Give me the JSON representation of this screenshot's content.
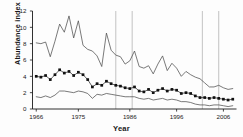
{
  "chart_data": {
    "type": "line",
    "title": "",
    "xlabel": "Year",
    "ylabel": "Abundance index",
    "xlim": [
      1965.2,
      2008.8
    ],
    "ylim": [
      0,
      12
    ],
    "grid": false,
    "legend": "none",
    "y_ticks": [
      0,
      2,
      4,
      6,
      8,
      10,
      12
    ],
    "x_ticks": [
      1966,
      1975,
      1986,
      1996,
      2006
    ],
    "x_tick_labels": [
      "1966",
      "1975",
      "1986",
      "1996",
      "2006"
    ],
    "x": [
      1966,
      1967,
      1968,
      1969,
      1970,
      1971,
      1972,
      1973,
      1974,
      1975,
      1976,
      1977,
      1978,
      1979,
      1980,
      1981,
      1982,
      1983,
      1984,
      1985,
      1986,
      1987,
      1988,
      1989,
      1990,
      1991,
      1992,
      1993,
      1994,
      1995,
      1996,
      1997,
      1998,
      1999,
      2000,
      2001,
      2002,
      2003,
      2004,
      2005,
      2006,
      2007,
      2008
    ],
    "series": [
      {
        "name": "Upper confidence bound",
        "style": "thin-line",
        "values": [
          8.1,
          8.0,
          8.2,
          6.4,
          8.3,
          10.4,
          9.4,
          11.4,
          8.7,
          10.8,
          7.8,
          7.3,
          7.1,
          6.5,
          5.2,
          9.3,
          7.2,
          6.6,
          6.4,
          5.5,
          5.9,
          7.1,
          5.2,
          5.0,
          5.3,
          4.3,
          5.5,
          6.5,
          4.7,
          5.6,
          5.0,
          4.0,
          4.6,
          4.2,
          3.9,
          3.7,
          3.2,
          2.7,
          2.7,
          2.9,
          2.6,
          2.4,
          2.5
        ]
      },
      {
        "name": "Abundance index",
        "style": "line-with-square-markers",
        "values": [
          4.0,
          3.9,
          4.1,
          3.6,
          4.2,
          4.8,
          4.4,
          4.6,
          4.1,
          4.5,
          4.2,
          3.6,
          2.7,
          3.1,
          2.9,
          3.4,
          3.1,
          2.9,
          2.8,
          2.6,
          2.5,
          2.7,
          2.2,
          2.1,
          2.4,
          2.0,
          2.3,
          2.5,
          2.2,
          2.4,
          2.3,
          1.9,
          2.0,
          1.9,
          1.6,
          1.4,
          1.4,
          1.3,
          1.4,
          1.3,
          1.2,
          1.1,
          1.2
        ]
      },
      {
        "name": "Lower confidence bound",
        "style": "thin-line",
        "values": [
          1.5,
          1.4,
          1.6,
          1.4,
          1.7,
          2.2,
          2.2,
          2.1,
          2.0,
          2.2,
          2.1,
          1.9,
          1.3,
          1.8,
          1.7,
          1.9,
          1.8,
          1.7,
          1.6,
          1.5,
          1.5,
          1.5,
          1.3,
          1.2,
          1.3,
          1.1,
          1.2,
          1.3,
          1.1,
          1.2,
          1.1,
          0.9,
          0.9,
          0.8,
          0.6,
          0.5,
          0.5,
          0.4,
          0.5,
          0.5,
          0.4,
          0.3,
          0.4
        ]
      }
    ],
    "reference_lines": {
      "orientation": "vertical",
      "x": [
        1983.0,
        1986.5,
        2001.5,
        2005.0
      ]
    },
    "colors": {
      "axis": "#1a1a1a",
      "line": "#4d4d4d",
      "marker": "#111111",
      "reference_line": "#b4b4b4",
      "background": "#fdfdfd"
    }
  }
}
